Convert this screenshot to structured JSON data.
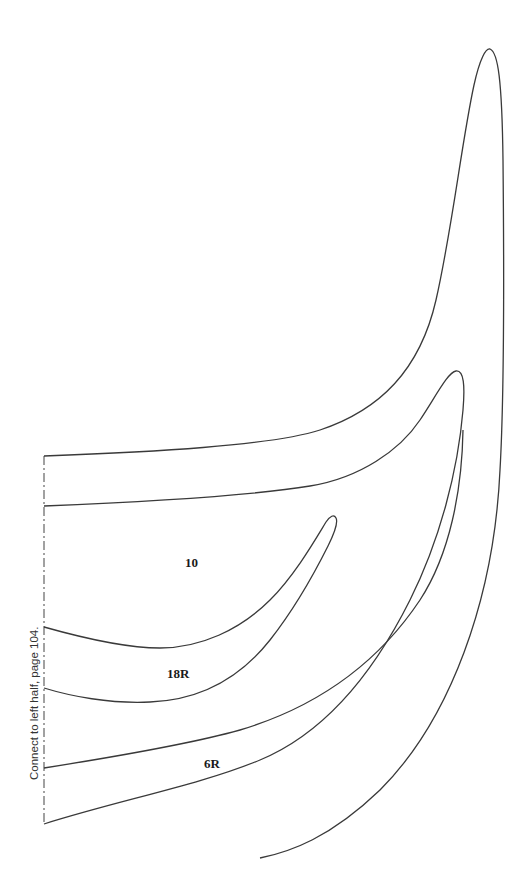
{
  "pattern": {
    "connect_note": "Connect to left half, page 104.",
    "pieces": [
      {
        "label": "10"
      },
      {
        "label": "18R"
      },
      {
        "label": "6R"
      }
    ],
    "line_color": "#3a3a3a"
  }
}
